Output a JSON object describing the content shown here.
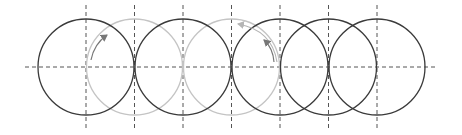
{
  "diagram": {
    "colors": {
      "background": "#ffffff",
      "circle_dark": "#3a3a3a",
      "circle_light": "#c4c4c4",
      "guide_line": "#555555",
      "arrow_dark": "#777777",
      "arrow_light": "#b5b5b5"
    },
    "axis": {
      "y": 67,
      "x_start": 25,
      "x_end": 437
    },
    "guides": {
      "y_top": 5,
      "y_bottom": 129,
      "x": [
        86,
        134.5,
        183,
        231.5,
        280,
        328.5,
        377
      ]
    },
    "circle_radius": 48,
    "circles": [
      {
        "cx": 86,
        "tone": "dark"
      },
      {
        "cx": 134.5,
        "tone": "light"
      },
      {
        "cx": 183,
        "tone": "dark"
      },
      {
        "cx": 231.5,
        "tone": "light"
      },
      {
        "cx": 280,
        "tone": "dark"
      },
      {
        "cx": 328.5,
        "tone": "dark"
      },
      {
        "cx": 377,
        "tone": "dark"
      }
    ],
    "arrows": [
      {
        "name": "left-rotation-arrow",
        "direction": "clockwise",
        "tone": "dark"
      },
      {
        "name": "right-rotation-arrow-inner",
        "direction": "counterclockwise",
        "tone": "dark"
      },
      {
        "name": "right-rotation-arrow-outer",
        "direction": "counterclockwise",
        "tone": "light"
      }
    ]
  }
}
